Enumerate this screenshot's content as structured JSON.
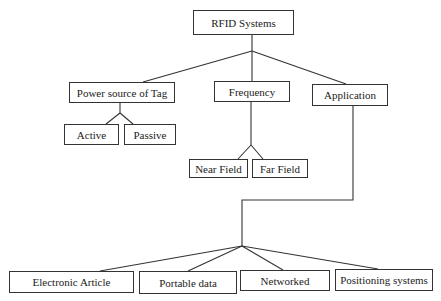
{
  "diagram": {
    "type": "tree",
    "root": {
      "label": "RFID Systems"
    },
    "categories": [
      {
        "label": "Power source of Tag",
        "children": [
          {
            "label": "Active"
          },
          {
            "label": "Passive"
          }
        ]
      },
      {
        "label": "Frequency",
        "children": [
          {
            "label": "Near Field"
          },
          {
            "label": "Far Field"
          }
        ]
      },
      {
        "label": "Application",
        "children": [
          {
            "label": "Electronic Article"
          },
          {
            "label": "Portable data"
          },
          {
            "label": "Networked"
          },
          {
            "label": "Positioning systems"
          }
        ]
      }
    ]
  },
  "colors": {
    "line": "#333333",
    "box_border": "#333333",
    "text": "#222222",
    "background": "#ffffff"
  }
}
